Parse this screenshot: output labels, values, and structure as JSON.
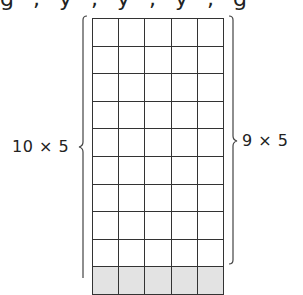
{
  "top_text_fragment": "g , y , y , y , g",
  "diagram": {
    "grid": {
      "columns": 5,
      "rows": 10,
      "white_rows": 9,
      "shaded_rows": 1,
      "shaded_color": "#e3e3e3",
      "line_color": "#333333"
    },
    "left_brace": {
      "label": "10 × 5",
      "spans_rows": 10
    },
    "right_brace": {
      "label": "9 × 5",
      "spans_rows": 9
    }
  }
}
